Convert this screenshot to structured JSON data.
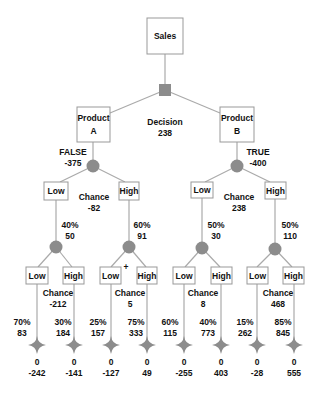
{
  "title": "Sales",
  "decision": {
    "label": "Decision",
    "value": "238",
    "color": "#8c8c8c"
  },
  "branches": [
    {
      "name": "Product",
      "letter": "A",
      "flag": "FALSE",
      "cost": "-375",
      "chance": {
        "label": "Chance",
        "value": "-82"
      },
      "outcomes": [
        {
          "label": "Low",
          "pct": "40%",
          "value": "50",
          "chance": {
            "label": "Chance",
            "value": "-212"
          },
          "leaves": [
            {
              "label": "Low",
              "pct": "70%",
              "value": "83",
              "top": "0",
              "payoff": "-242"
            },
            {
              "label": "High",
              "pct": "30%",
              "value": "184",
              "top": "0",
              "payoff": "-141"
            }
          ]
        },
        {
          "label": "High",
          "pct": "60%",
          "value": "91",
          "chance": {
            "label": "Chance",
            "value": "5"
          },
          "leaves": [
            {
              "label": "Low",
              "pct": "25%",
              "value": "157",
              "top": "0",
              "payoff": "-127"
            },
            {
              "label": "High",
              "pct": "75%",
              "value": "333",
              "top": "0",
              "payoff": "49"
            }
          ]
        }
      ]
    },
    {
      "name": "Product",
      "letter": "B",
      "flag": "TRUE",
      "cost": "-400",
      "chance": {
        "label": "Chance",
        "value": "238"
      },
      "outcomes": [
        {
          "label": "Low",
          "pct": "50%",
          "value": "30",
          "chance": {
            "label": "Chance",
            "value": "8"
          },
          "leaves": [
            {
              "label": "Low",
              "pct": "60%",
              "value": "115",
              "top": "0",
              "payoff": "-255"
            },
            {
              "label": "High",
              "pct": "40%",
              "value": "773",
              "top": "0",
              "payoff": "403"
            }
          ]
        },
        {
          "label": "High",
          "pct": "50%",
          "value": "110",
          "chance": {
            "label": "Chance",
            "value": "468"
          },
          "leaves": [
            {
              "label": "Low",
              "pct": "15%",
              "value": "262",
              "top": "0",
              "payoff": "-28"
            },
            {
              "label": "High",
              "pct": "85%",
              "value": "845",
              "top": "0",
              "payoff": "555"
            }
          ]
        }
      ]
    }
  ],
  "marker": {
    "label": "+"
  }
}
